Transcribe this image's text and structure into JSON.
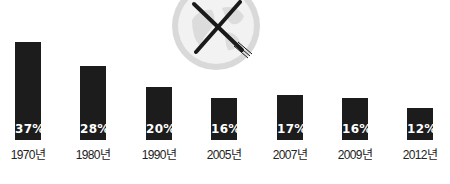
{
  "chart_data": {
    "type": "bar",
    "title": "",
    "xlabel": "",
    "ylabel": "",
    "categories": [
      "1970년",
      "1980년",
      "1990년",
      "2005년",
      "2007년",
      "2009년",
      "2012년"
    ],
    "values": [
      37,
      28,
      20,
      16,
      17,
      16,
      12
    ],
    "value_labels": [
      "37%",
      "28%",
      "20%",
      "16%",
      "17%",
      "16%",
      "12%"
    ],
    "unit": "%",
    "ylim": [
      0,
      37
    ],
    "grid": false,
    "legend": null,
    "colors": {
      "bar": "#1c1c1c",
      "value_text": "#ffffff",
      "label_text": "#222222",
      "globe": "#d6d6d6"
    },
    "decoration": "globe-with-crossed-knife-and-fork-icon"
  }
}
